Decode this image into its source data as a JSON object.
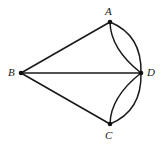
{
  "figure": {
    "background_color": "#ffffff",
    "stroke_color": "#1a1a1a",
    "vertex_dot_color": "#111111",
    "vertices": [
      {
        "id": "A",
        "label": "A",
        "x": 110,
        "y": 22
      },
      {
        "id": "B",
        "label": "B",
        "x": 21,
        "y": 73
      },
      {
        "id": "C",
        "label": "C",
        "x": 110,
        "y": 124
      },
      {
        "id": "D",
        "label": "D",
        "x": 141,
        "y": 73
      }
    ],
    "straight_edges": [
      {
        "name": "edge-B-A",
        "from": "B",
        "to": "A"
      },
      {
        "name": "edge-B-D",
        "from": "B",
        "to": "D"
      },
      {
        "name": "edge-B-C",
        "from": "B",
        "to": "C"
      }
    ],
    "arcs": [
      {
        "name": "arc-A-D-inner",
        "from": "A",
        "to": "D",
        "bulge": "left-toward-B"
      },
      {
        "name": "arc-A-D-outer",
        "from": "A",
        "to": "D",
        "bulge": "right-outward"
      },
      {
        "name": "arc-C-D-inner",
        "from": "C",
        "to": "D",
        "bulge": "left-toward-B"
      },
      {
        "name": "arc-C-D-outer",
        "from": "C",
        "to": "D",
        "bulge": "right-outward"
      }
    ],
    "labels": {
      "A": "A",
      "B": "B",
      "C": "C",
      "D": "D"
    }
  }
}
